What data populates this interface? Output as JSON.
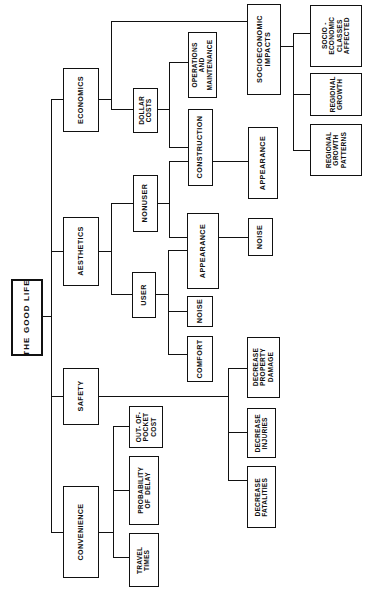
{
  "diagram": {
    "title": "THE GOOD LIFE",
    "type": "hierarchical-tree",
    "orientation": "rotated-90-counterclockwise",
    "root": {
      "label": "THE GOOD LIFE"
    },
    "nodes": {
      "root": {
        "label": "THE GOOD LIFE"
      },
      "economics": {
        "label": "ECONOMICS"
      },
      "aesthetics": {
        "label": "AESTHETICS"
      },
      "safety": {
        "label": "SAFETY"
      },
      "convenience": {
        "label": "CONVENIENCE"
      },
      "dollar_costs": {
        "label": "DOLLAR\nCOSTS"
      },
      "socio_impacts": {
        "label": "SOCIOECONOMIC\nIMPACTS"
      },
      "ops_maint": {
        "label": "OPERATIONS\nAND\nMAINTENANCE"
      },
      "construction": {
        "label": "CONSTRUCTION"
      },
      "socio_classes": {
        "label": "SOCIO -\nECONOMIC\nCLASSES\nAFFECTED"
      },
      "regional_growth": {
        "label": "REGIONAL\nGROWTH"
      },
      "regional_patterns": {
        "label": "REGIONAL\nGROWTH\nPATTERNS"
      },
      "nonuser": {
        "label": "NONUSER"
      },
      "user": {
        "label": "USER"
      },
      "nonuser_appearance": {
        "label": "APPEARANCE"
      },
      "nonuser_noise": {
        "label": "NOISE"
      },
      "user_appearance": {
        "label": "APPEARANCE"
      },
      "user_noise": {
        "label": "NOISE"
      },
      "user_comfort": {
        "label": "COMFORT"
      },
      "decrease_property_damage": {
        "label": "DECREASE\nPROPERTY\nDAMAGE"
      },
      "decrease_injuries": {
        "label": "DECREASE\nINJURIES"
      },
      "decrease_fatalities": {
        "label": "DECREASE\nFATALITIES"
      },
      "out_of_pocket": {
        "label": "OUT- OF-\nPOCKET\nCOST"
      },
      "probability_delay": {
        "label": "PROBABILITY\nOF  DELAY"
      },
      "travel_times": {
        "label": "TRAVEL\nTIMES"
      }
    },
    "edges": [
      [
        "root",
        "economics"
      ],
      [
        "root",
        "aesthetics"
      ],
      [
        "root",
        "safety"
      ],
      [
        "root",
        "convenience"
      ],
      [
        "economics",
        "dollar_costs"
      ],
      [
        "economics",
        "socio_impacts"
      ],
      [
        "dollar_costs",
        "ops_maint"
      ],
      [
        "dollar_costs",
        "construction"
      ],
      [
        "socio_impacts",
        "socio_classes"
      ],
      [
        "socio_impacts",
        "regional_growth"
      ],
      [
        "socio_impacts",
        "regional_patterns"
      ],
      [
        "aesthetics",
        "nonuser"
      ],
      [
        "aesthetics",
        "user"
      ],
      [
        "nonuser",
        "nonuser_appearance"
      ],
      [
        "nonuser",
        "nonuser_noise"
      ],
      [
        "user",
        "user_appearance"
      ],
      [
        "user",
        "user_noise"
      ],
      [
        "user",
        "user_comfort"
      ],
      [
        "safety",
        "decrease_property_damage"
      ],
      [
        "safety",
        "decrease_injuries"
      ],
      [
        "safety",
        "decrease_fatalities"
      ],
      [
        "convenience",
        "out_of_pocket"
      ],
      [
        "convenience",
        "probability_delay"
      ],
      [
        "convenience",
        "travel_times"
      ]
    ],
    "colors": {
      "line": "#111111",
      "box_fill": "#ffffff",
      "text": "#101010"
    }
  }
}
